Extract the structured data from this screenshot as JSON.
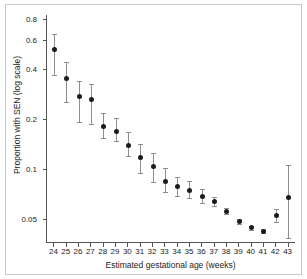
{
  "chart_data": {
    "type": "scatter",
    "title": "",
    "xlabel": "Estimated gestational age (weeks)",
    "ylabel": "Proportion with SEN (log scale)",
    "yscale": "log",
    "ylim": [
      0.036,
      0.85
    ],
    "xlim": [
      23.4,
      43.6
    ],
    "grid": false,
    "legend": null,
    "ytick_labels": [
      "0.8",
      "0.6",
      "0.4",
      "0.2",
      "0.1",
      "0.05"
    ],
    "ytick_values": [
      0.8,
      0.6,
      0.4,
      0.2,
      0.1,
      0.05
    ],
    "xtick_labels": [
      "24",
      "25",
      "26",
      "27",
      "28",
      "29",
      "30",
      "31",
      "32",
      "33",
      "34",
      "35",
      "36",
      "37",
      "38",
      "39",
      "40",
      "41",
      "42",
      "43"
    ],
    "categories": [
      24,
      25,
      26,
      27,
      28,
      29,
      30,
      31,
      32,
      33,
      34,
      35,
      36,
      37,
      38,
      39,
      40,
      41,
      42,
      43
    ],
    "series": [
      {
        "name": "Proportion with SEN",
        "marker": "filled-circle",
        "color": "#1b1b1b",
        "errorbar_color": "#8e8e8e",
        "values": [
          0.528,
          0.352,
          0.276,
          0.264,
          0.182,
          0.168,
          0.14,
          0.118,
          0.104,
          0.085,
          0.079,
          0.075,
          0.069,
          0.064,
          0.056,
          0.0485,
          0.0445,
          0.0425,
          0.0525,
          0.0675
        ],
        "ci_lower": [
          0.372,
          0.255,
          0.194,
          0.188,
          0.154,
          0.148,
          0.12,
          0.0955,
          0.0835,
          0.0735,
          0.0695,
          0.0675,
          0.0625,
          0.0605,
          0.0538,
          0.047,
          0.0432,
          0.0412,
          0.048,
          0.0385
        ],
        "ci_upper": [
          0.655,
          0.44,
          0.341,
          0.325,
          0.218,
          0.205,
          0.167,
          0.143,
          0.126,
          0.102,
          0.0905,
          0.0845,
          0.0765,
          0.0683,
          0.0582,
          0.05,
          0.0458,
          0.0438,
          0.0575,
          0.106
        ]
      }
    ]
  },
  "figure": {
    "background_color": "#ffffff",
    "frame_color": "#c9c9c9",
    "axis_color": "#555555"
  }
}
